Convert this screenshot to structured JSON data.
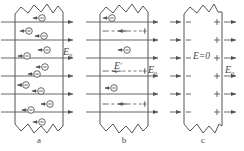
{
  "figure": {
    "stroke_color": "#555555",
    "bg_color": "#ffffff",
    "panels": [
      {
        "id": "a",
        "caption": "a",
        "external_field_label": "E",
        "external_field_sub": "0",
        "field_line_count": 6,
        "charge_symbol": "−",
        "charge_count": 12,
        "description": "free electrons drift opposite to the external field"
      },
      {
        "id": "b",
        "caption": "b",
        "external_field_label": "E",
        "external_field_sub": "0",
        "internal_field_label": "E",
        "internal_field_prime": "′",
        "field_line_count": 6,
        "charge_symbol": "−",
        "charge_count": 3,
        "dashed_row_count": 3,
        "dashed_minus": "−",
        "dashed_plus": "+",
        "description": "induced internal field opposes the external field"
      },
      {
        "id": "c",
        "caption": "c",
        "external_field_label": "E",
        "external_field_sub": "0",
        "interior_field_label": "E=0",
        "row_count": 6,
        "left_surface_symbol": "−",
        "right_surface_symbol": "+",
        "description": "equilibrium: interior field is zero, surface charges remain"
      }
    ]
  }
}
